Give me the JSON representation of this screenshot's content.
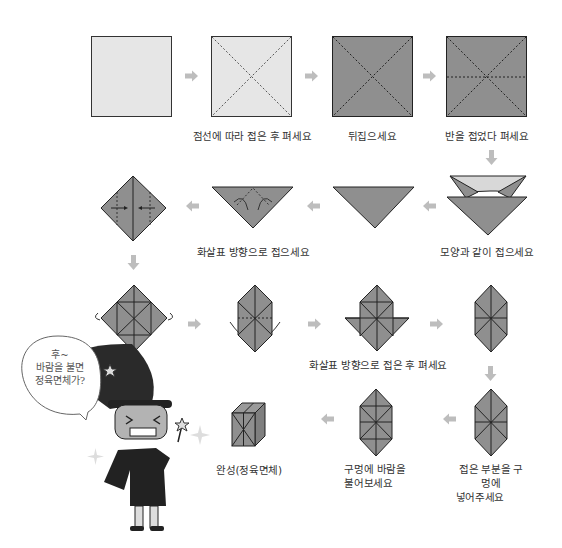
{
  "colors": {
    "paper_light": "#e6e6e6",
    "paper_dark": "#8f8f8f",
    "paper_mid": "#d6d6d6",
    "stroke": "#222222",
    "arrow": "#b8b8b8",
    "text": "#333333"
  },
  "steps": [
    {
      "id": 1,
      "label": ""
    },
    {
      "id": 2,
      "label": "점선에 따라 접은 후 펴세요"
    },
    {
      "id": 3,
      "label": "뒤집으세요"
    },
    {
      "id": 4,
      "label": "반을 접었다 펴세요"
    },
    {
      "id": 5,
      "label": "모양과 같이 접으세요"
    },
    {
      "id": 6,
      "label": ""
    },
    {
      "id": 7,
      "label": "화살표 방향으로 접으세요"
    },
    {
      "id": 8,
      "label": ""
    },
    {
      "id": 9,
      "label": ""
    },
    {
      "id": 10,
      "label": "화살표 방향으로 접은 후 펴세요"
    },
    {
      "id": 11,
      "label": ""
    },
    {
      "id": 12,
      "label_line1": "접은 부분을 구멍에",
      "label_line2": "넣어주세요"
    },
    {
      "id": 13,
      "label_line1": "구멍에 바람을",
      "label_line2": "불어보세요"
    },
    {
      "id": 14,
      "label": "완성(정육면체)"
    }
  ],
  "character": {
    "speech_bubble": {
      "line1": "후~",
      "line2": "바람을 불면",
      "line3": "정육면체가?"
    }
  }
}
